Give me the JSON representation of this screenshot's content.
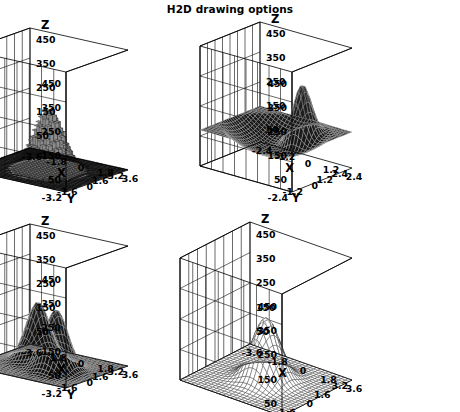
{
  "title": "H2D drawing options",
  "canvas": {
    "width": 460,
    "height": 412,
    "background": "#ffffff"
  },
  "axis_titles": {
    "x": "X",
    "y": "Y",
    "z": "Z"
  },
  "chart_data": [
    {
      "id": "pad-top-left",
      "type": "surface",
      "draw_option": "LEGO",
      "title": "",
      "xlabel": "X",
      "ylabel": "Y",
      "zlabel": "Z",
      "xticks": [
        "3.6",
        "1.8",
        "0",
        "-1.8",
        "-3.6"
      ],
      "yticks": [
        "-3.2",
        "-1.6",
        "0",
        "1.6",
        "3.2"
      ],
      "zticks": [
        "50",
        "150",
        "250",
        "350",
        "450"
      ],
      "zticks_right": [
        "450",
        "350",
        "250",
        "150",
        "50"
      ],
      "xlim": [
        -3.6,
        3.6
      ],
      "ylim": [
        -3.2,
        3.2
      ],
      "zlim": [
        0,
        500
      ],
      "grid": true,
      "peaks": [
        {
          "cx": 0.0,
          "cy": 0.0,
          "amplitude": 250,
          "sigma": 0.85
        }
      ],
      "surface_fill": "#8f8f8f",
      "mesh_color": "#141414",
      "floor_fill": "#1b1b1b"
    },
    {
      "id": "pad-top-right",
      "type": "surface",
      "draw_option": "SURF",
      "title": "",
      "xlabel": "X",
      "ylabel": "Y",
      "zlabel": "Z",
      "xticks": [
        "2.4",
        "1.2",
        "0",
        "-1.2",
        "-2.4"
      ],
      "yticks": [
        "-2.4",
        "-1.2",
        "0",
        "1.2",
        "2.4"
      ],
      "zticks": [
        "50",
        "150",
        "250",
        "350",
        "450"
      ],
      "zticks_right": [
        "450",
        "350",
        "250",
        "150",
        "50"
      ],
      "xlim": [
        -2.4,
        2.4
      ],
      "ylim": [
        -2.4,
        2.4
      ],
      "zlim": [
        0,
        500
      ],
      "grid": true,
      "peaks": [
        {
          "cx": -0.7,
          "cy": -1.0,
          "amplitude": 260,
          "sigma": 0.45
        }
      ],
      "surface_fill": "#111111",
      "mesh_color": "#bdbdbd",
      "floor_fill": "#121212"
    },
    {
      "id": "pad-bottom-left",
      "type": "surface",
      "draw_option": "SURF1",
      "title": "",
      "xlabel": "X",
      "ylabel": "Y",
      "zlabel": "Z",
      "xticks": [
        "3.6",
        "1.8",
        "0",
        "-1.8",
        "-3.6"
      ],
      "yticks": [
        "-3.2",
        "-1.6",
        "0",
        "1.6",
        "3.2"
      ],
      "zticks": [
        "50",
        "150",
        "250",
        "350",
        "450"
      ],
      "zticks_right": [
        "450",
        "350",
        "250",
        "150",
        "50"
      ],
      "xlim": [
        -3.6,
        3.6
      ],
      "ylim": [
        -3.2,
        3.2
      ],
      "zlim": [
        0,
        500
      ],
      "grid": true,
      "peaks": [
        {
          "cx": 1.1,
          "cy": -0.5,
          "amplitude": 245,
          "sigma": 0.72
        },
        {
          "cx": -0.9,
          "cy": 0.4,
          "amplitude": 250,
          "sigma": 0.72
        }
      ],
      "surface_fill": "#1a1a1a",
      "mesh_color": "#cccccc",
      "floor_fill": "#141414"
    },
    {
      "id": "pad-bottom-right",
      "type": "surface",
      "draw_option": "SURF2",
      "title": "",
      "xlabel": "X",
      "ylabel": "Y",
      "zlabel": "Z",
      "xticks": [
        "3.6",
        "1.8",
        "0",
        "-1.8",
        "-3.6"
      ],
      "yticks": [
        "-3.2",
        "-1.6",
        "0",
        "1.6",
        "3.2"
      ],
      "zticks": [
        "50",
        "150",
        "250",
        "350",
        "450"
      ],
      "zticks_right": [
        "450",
        "350",
        "250",
        "150",
        "50"
      ],
      "xlim": [
        -3.6,
        3.6
      ],
      "ylim": [
        -3.2,
        3.2
      ],
      "zlim": [
        0,
        500
      ],
      "grid": true,
      "peaks": [
        {
          "cx": 0.0,
          "cy": 0.0,
          "amplitude": 255,
          "sigma": 0.8
        }
      ],
      "surface_fill": "#ffffff",
      "mesh_color": "#333333",
      "floor_fill": "#ffffff"
    }
  ]
}
